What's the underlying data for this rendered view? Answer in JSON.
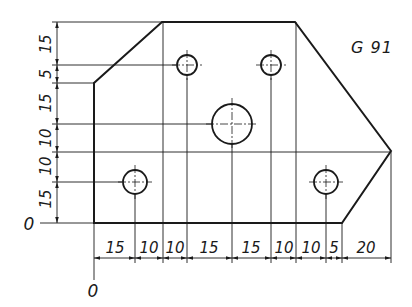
{
  "title": "G 91",
  "units_px_per_mm": 2.73,
  "origin_px": {
    "x": 94,
    "y": 223
  },
  "colors": {
    "line": "#1a1a1a",
    "background": "#ffffff"
  },
  "origin_labels": {
    "x_axis": "0",
    "y_axis": "0"
  },
  "outline_mm": [
    [
      0,
      0
    ],
    [
      90,
      0
    ],
    [
      110,
      27
    ],
    [
      75,
      70
    ],
    [
      25,
      70
    ],
    [
      0,
      50
    ]
  ],
  "holes_mm": [
    {
      "x": 15,
      "y": 15,
      "d": "small"
    },
    {
      "x": 35,
      "y": 55,
      "d": "small"
    },
    {
      "x": 65,
      "y": 55,
      "d": "small"
    },
    {
      "x": 50,
      "y": 35,
      "d": "large"
    },
    {
      "x": 85,
      "y": 15,
      "d": "small"
    }
  ],
  "horizontal_dimensions": {
    "labels": [
      "15",
      "10",
      "10",
      "15",
      "15",
      "10",
      "10",
      "5",
      "20"
    ],
    "positions_mm": [
      0,
      15,
      25,
      35,
      50,
      65,
      75,
      85,
      90,
      110
    ]
  },
  "vertical_dimensions": {
    "labels": [
      "15",
      "10",
      "10",
      "15",
      "5",
      "15"
    ],
    "positions_mm": [
      0,
      15,
      25,
      35,
      50,
      55,
      70
    ]
  }
}
